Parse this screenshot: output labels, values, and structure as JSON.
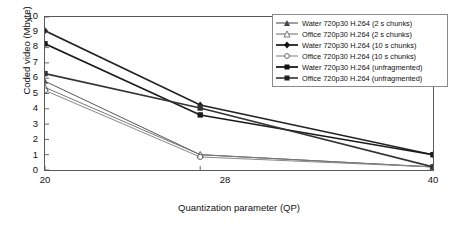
{
  "chart_data": {
    "type": "line",
    "title": "",
    "xlabel": "Quantization parameter (QP)",
    "ylabel": "Coded video (Mbyte)",
    "x": [
      20,
      28,
      40
    ],
    "xticklabels": [
      "20",
      "28",
      "40"
    ],
    "yticklabels": [
      "0",
      "1",
      "2",
      "3",
      "4",
      "5",
      "6",
      "7",
      "8",
      "9",
      "10"
    ],
    "xlim": [
      20,
      40
    ],
    "ylim": [
      0,
      10
    ],
    "grid": false,
    "legend_position": "top-right",
    "series": [
      {
        "name": "Water 720p30 H.264 (2 s chunks)",
        "marker": "triangle-filled",
        "color": "#555555",
        "values": [
          5.8,
          1.0,
          0.2
        ]
      },
      {
        "name": "Office 720p30 H.264 (2 s chunks)",
        "marker": "triangle-open",
        "color": "#777777",
        "values": [
          5.4,
          1.0,
          0.2
        ]
      },
      {
        "name": "Water 720p30 H.264 (10 s chunks)",
        "marker": "diamond-filled",
        "color": "#222222",
        "values": [
          9.1,
          4.25,
          1.0
        ]
      },
      {
        "name": "Office 720p30 H.264 (10 s chunks)",
        "marker": "circle-open",
        "color": "#888888",
        "values": [
          5.2,
          0.85,
          0.2
        ]
      },
      {
        "name": "Water 720p30 H.264 (unfragmented)",
        "marker": "square-filled",
        "color": "#1a1a1a",
        "values": [
          8.25,
          3.6,
          1.0
        ]
      },
      {
        "name": "Office 720p30 H.264 (unfragmented)",
        "marker": "square-filled",
        "color": "#333333",
        "values": [
          6.3,
          4.05,
          0.2
        ]
      }
    ]
  },
  "axes": {
    "y_ticks": [
      "10",
      "9",
      "8",
      "7",
      "6",
      "5",
      "4",
      "3",
      "2",
      "1",
      "0"
    ],
    "x_ticks": [
      "20",
      "28",
      "40"
    ],
    "y_title": "Coded video (Mbyte)",
    "x_title": "Quantization parameter (QP)"
  },
  "legend": {
    "items": [
      {
        "label": "Water 720p30 H.264 (2 s chunks)"
      },
      {
        "label": "Office 720p30 H.264 (2 s chunks)"
      },
      {
        "label": "Water 720p30 H.264 (10 s chunks)"
      },
      {
        "label": "Office 720p30 H.264 (10 s chunks)"
      },
      {
        "label": "Water 720p30 H.264 (unfragmented)"
      },
      {
        "label": "Office 720p30 H.264 (unfragmented)"
      }
    ]
  }
}
